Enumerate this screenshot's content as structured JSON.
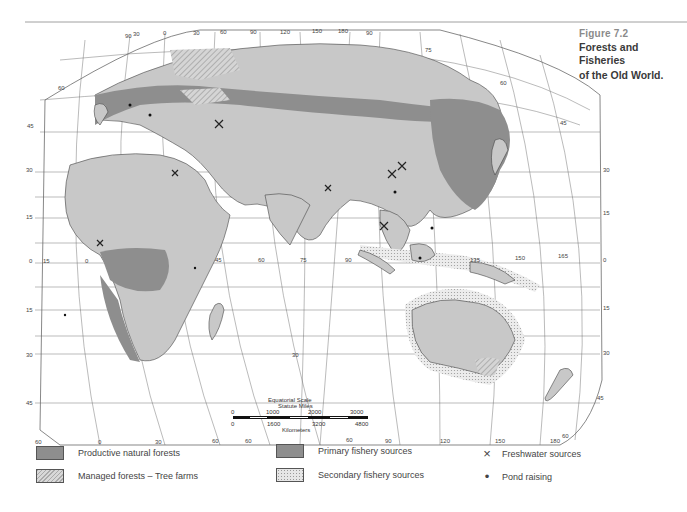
{
  "caption": {
    "figure": "Figure 7.2",
    "title_line1": "Forests and Fisheries",
    "title_line2": "of the Old World."
  },
  "legend": {
    "productive": "Productive natural forests",
    "managed": "Managed forests – Tree farms",
    "primary": "Primary fishery sources",
    "secondary": "Secondary fishery sources",
    "freshwater": "Freshwater sources",
    "pond": "Pond raising",
    "freshwater_symbol": "×",
    "pond_symbol": "•"
  },
  "scale": {
    "title": "Equatorial Scale",
    "miles_label": "Statute Miles",
    "km_label": "Kilometers",
    "miles": [
      "0",
      "1000",
      "2000",
      "3000"
    ],
    "km": [
      "0",
      "1600",
      "3200",
      "4800"
    ]
  },
  "graticule": {
    "top_longitudes": [
      "90",
      "30",
      "0",
      "30",
      "60",
      "90",
      "120",
      "150",
      "180",
      "90"
    ],
    "bottom_longitudes": [
      "60",
      "0",
      "30",
      "60",
      "60",
      "90",
      "120",
      "150",
      "180",
      "60"
    ],
    "left_latitudes": [
      "60",
      "45",
      "30",
      "15",
      "0",
      "15",
      "30",
      "45"
    ],
    "right_latitudes": [
      "75",
      "60",
      "45",
      "30",
      "15",
      "0",
      "15",
      "30",
      "45"
    ],
    "equator_longitudes": [
      "15",
      "0",
      "45",
      "60",
      "75",
      "90",
      "135",
      "150",
      "165"
    ],
    "center_label": "30"
  },
  "colors": {
    "land": "#c8c8c8",
    "forest": "#8e8e8e",
    "lines": "#555555"
  }
}
